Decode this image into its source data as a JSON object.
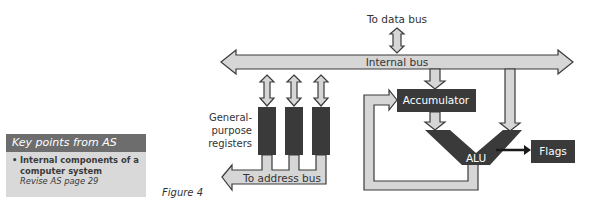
{
  "key_points": {
    "title": "Key points from AS",
    "item": "Internal components of a computer system",
    "reference": "Revise AS page 29"
  },
  "figure": {
    "label": "Figure 4"
  },
  "diagram": {
    "data_bus_label": "To data bus",
    "internal_bus_label": "Internal bus",
    "registers_label_line1": "General-",
    "registers_label_line2": "purpose",
    "registers_label_line3": "registers",
    "address_bus_label": "To address bus",
    "accumulator_label": "Accumulator",
    "alu_label": "ALU",
    "flags_label": "Flags",
    "colors": {
      "bus_fill": "#d6d6d6",
      "bus_stroke": "#3a3a3a",
      "component_fill": "#3a3a3a",
      "component_text": "#ffffff"
    }
  }
}
